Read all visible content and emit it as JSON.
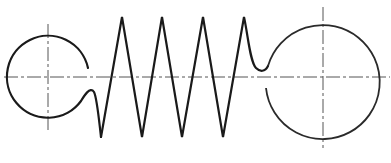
{
  "diagram": {
    "colors": {
      "line": "#1a1a1a",
      "centerline": "#555555",
      "background": "#ffffff"
    },
    "left_hook": {
      "cx": 48,
      "cy": 77,
      "r": 41,
      "label": ""
    },
    "right_hook": {
      "cx": 323,
      "cy": 77,
      "r": 57,
      "label": ""
    },
    "coils": {
      "top_peaks_x": [
        122,
        162,
        203,
        244
      ],
      "bottom_peaks_x": [
        101,
        142,
        182,
        223
      ],
      "top_y": 17,
      "bottom_y": 137
    },
    "axis_y": 77
  }
}
